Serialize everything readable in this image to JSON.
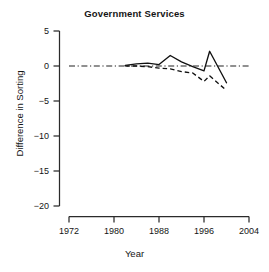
{
  "chart_data": {
    "type": "line",
    "title": "Government Services",
    "xlabel": "Year",
    "ylabel": "Difference in Sorting",
    "xlim": [
      1972,
      2004
    ],
    "ylim": [
      -20,
      5
    ],
    "xticks": [
      1972,
      1980,
      1988,
      1996,
      2004
    ],
    "yticks": [
      5,
      0,
      -5,
      -10,
      -15,
      -20
    ],
    "xtick_labels": [
      "1972",
      "1980",
      "1988",
      "1996",
      "2004"
    ],
    "ytick_labels": [
      "5",
      "0",
      "-5",
      "-10",
      "-15",
      "-20"
    ],
    "grid": false,
    "legend": "none",
    "reference_line": {
      "name": "zero-line",
      "y": 0,
      "style": "dash-dot",
      "x_start": 1972,
      "x_end": 2004
    },
    "series": [
      {
        "name": "solid-series",
        "style": "solid",
        "x": [
          1982,
          1984,
          1986,
          1988,
          1990,
          1992,
          1994,
          1996,
          1997,
          2000
        ],
        "values": [
          0.1,
          0.3,
          0.4,
          0.2,
          1.5,
          0.6,
          -0.1,
          -0.7,
          2.1,
          -2.4
        ]
      },
      {
        "name": "dashed-series",
        "style": "dashed",
        "x": [
          1982,
          1984,
          1986,
          1988,
          1990,
          1992,
          1994,
          1996,
          1997,
          2000
        ],
        "values": [
          0.0,
          0.0,
          -0.1,
          -0.3,
          -0.4,
          -0.8,
          -1.0,
          -2.2,
          -1.4,
          -3.5
        ]
      }
    ]
  },
  "axis": {
    "title": "Government Services",
    "x_title": "Year",
    "y_title": "Difference in Sorting"
  }
}
